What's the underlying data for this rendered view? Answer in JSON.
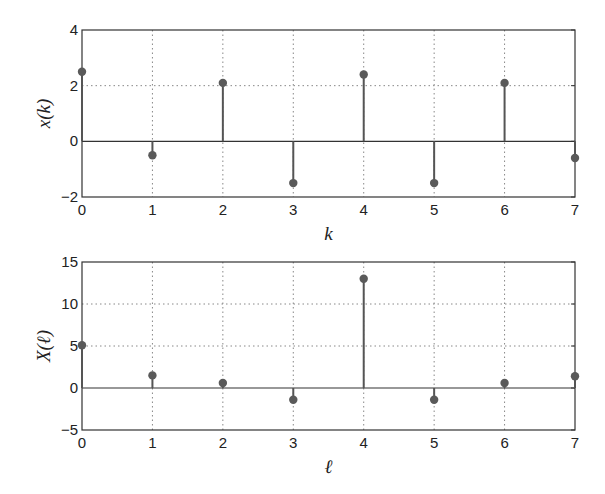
{
  "chart_data": [
    {
      "type": "stem",
      "title": "",
      "xlabel": "k",
      "ylabel": "x(k)",
      "x": [
        0,
        1,
        2,
        3,
        4,
        5,
        6,
        7
      ],
      "values": [
        2.5,
        -0.5,
        2.1,
        -1.5,
        2.4,
        -1.5,
        2.1,
        -0.6
      ],
      "xlim": [
        0,
        7
      ],
      "ylim": [
        -2,
        4
      ],
      "xticks": [
        "0",
        "1",
        "2",
        "3",
        "4",
        "5",
        "6",
        "7"
      ],
      "yticks": [
        "−2",
        "0",
        "2",
        "4"
      ],
      "ytick_values": [
        -2,
        0,
        2,
        4
      ],
      "grid": true,
      "legend": null
    },
    {
      "type": "stem",
      "title": "",
      "xlabel": "ℓ",
      "ylabel": "X(ℓ)",
      "x": [
        0,
        1,
        2,
        3,
        4,
        5,
        6,
        7
      ],
      "values": [
        5.1,
        1.5,
        0.6,
        -1.4,
        13.0,
        -1.4,
        0.6,
        1.4
      ],
      "xlim": [
        0,
        7
      ],
      "ylim": [
        -5,
        15
      ],
      "xticks": [
        "0",
        "1",
        "2",
        "3",
        "4",
        "5",
        "6",
        "7"
      ],
      "yticks": [
        "−5",
        "0",
        "5",
        "10",
        "15"
      ],
      "ytick_values": [
        -5,
        0,
        5,
        10,
        15
      ],
      "grid": true,
      "legend": null
    }
  ],
  "colors": {
    "stem": "#555555",
    "marker": "#5a5a5a",
    "axes": "#333333",
    "grid": "#888888"
  }
}
